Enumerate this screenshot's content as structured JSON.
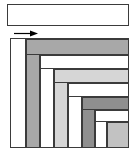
{
  "figure": {
    "width": 137,
    "height": 153,
    "background": "#ffffff",
    "stroke_color": "#3b3b3b",
    "stroke_width": 1
  },
  "top_box": {
    "name": "empty-rectangle",
    "x": 7,
    "y": 4,
    "width": 122,
    "height": 22,
    "fill": "#ffffff",
    "border": "#3b3b3b",
    "label": ""
  },
  "arrow": {
    "name": "right-arrow",
    "x": 14,
    "y": 30,
    "width": 24,
    "height": 7,
    "direction": "right",
    "color": "#000000",
    "label": ""
  },
  "spiral": {
    "name": "nested-l-spiral",
    "x": 10,
    "y": 38,
    "width": 119,
    "height": 110,
    "fill": "#ffffff",
    "border": "#3b3b3b",
    "colors": {
      "white": "#ffffff",
      "gray_mid": "#a8a8a8",
      "gray_light": "#d6d6d6",
      "gray_dark": "#8f8f8f",
      "gray_pale": "#c2c2c2",
      "outline": "#3b3b3b"
    },
    "bands": [
      {
        "id": 1,
        "name": "band-white-outer",
        "shape": "L",
        "color": "#ffffff",
        "x": 0,
        "y": 0,
        "w": 119,
        "h": 110,
        "arm_w": 15,
        "arm_h": 0,
        "orientation": "left-vertical"
      },
      {
        "id": 2,
        "name": "band-gray-top-1",
        "shape": "L",
        "color": "#a8a8a8",
        "x": 15,
        "y": 0,
        "w": 104,
        "h": 110,
        "arm_w": 14,
        "arm_h": 16,
        "orientation": "top-left"
      },
      {
        "id": 3,
        "name": "band-white-2",
        "shape": "L",
        "color": "#ffffff",
        "x": 29,
        "y": 16,
        "w": 90,
        "h": 94,
        "arm_w": 14,
        "arm_h": 14,
        "orientation": "top-left"
      },
      {
        "id": 4,
        "name": "band-gray-light-3",
        "shape": "L",
        "color": "#d6d6d6",
        "x": 43,
        "y": 30,
        "w": 76,
        "h": 80,
        "arm_w": 14,
        "arm_h": 14,
        "orientation": "top-left"
      },
      {
        "id": 5,
        "name": "band-white-4",
        "shape": "L",
        "color": "#ffffff",
        "x": 57,
        "y": 44,
        "w": 62,
        "h": 66,
        "arm_w": 14,
        "arm_h": 14,
        "orientation": "top-left"
      },
      {
        "id": 6,
        "name": "band-gray-dark-5",
        "shape": "L",
        "color": "#8f8f8f",
        "x": 71,
        "y": 58,
        "w": 48,
        "h": 52,
        "arm_w": 13,
        "arm_h": 13,
        "orientation": "top-left"
      },
      {
        "id": 7,
        "name": "band-white-6",
        "shape": "L",
        "color": "#ffffff",
        "x": 84,
        "y": 71,
        "w": 35,
        "h": 39,
        "arm_w": 12,
        "arm_h": 12,
        "orientation": "top-left"
      },
      {
        "id": 8,
        "name": "band-gray-pale-inner",
        "shape": "rect",
        "color": "#c2c2c2",
        "x": 96,
        "y": 83,
        "w": 23,
        "h": 27,
        "arm_w": 0,
        "arm_h": 0,
        "orientation": "center"
      }
    ]
  }
}
